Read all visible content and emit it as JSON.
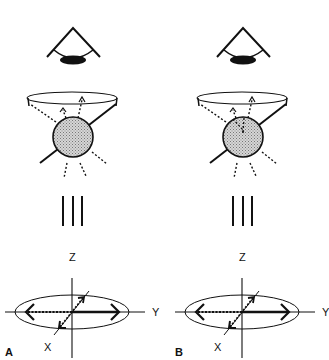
{
  "figure": {
    "panels": [
      {
        "id": "A",
        "label": "A",
        "axes": {
          "z": "Z",
          "y": "Y",
          "x": "X"
        },
        "sphere_internal_dotted_lines": false
      },
      {
        "id": "B",
        "label": "B",
        "axes": {
          "z": "Z",
          "y": "Y",
          "x": "X"
        },
        "sphere_internal_dotted_lines": true
      }
    ],
    "equivalence_symbol": "|||",
    "colors": {
      "ink": "#111111",
      "sphere_fill": "#bdbdbd",
      "background": "#ffffff"
    }
  }
}
